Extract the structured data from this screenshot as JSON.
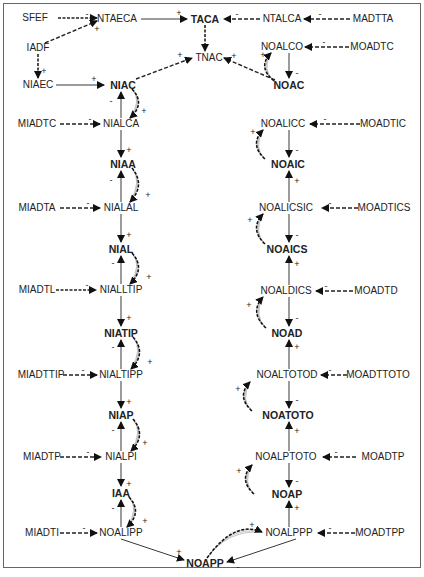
{
  "diagram": {
    "nodes": [
      {
        "id": "SFEF",
        "label": "SFEF",
        "x": 35,
        "y": 18,
        "bold": false
      },
      {
        "id": "NTAECA",
        "label": "NTAECA",
        "x": 117,
        "y": 19,
        "bold": false
      },
      {
        "id": "TACA",
        "label": "TACA",
        "x": 205,
        "y": 19,
        "bold": true
      },
      {
        "id": "NTALCA",
        "label": "NTALCA",
        "x": 282,
        "y": 19,
        "bold": false
      },
      {
        "id": "MADTTA",
        "label": "MADTTA",
        "x": 373,
        "y": 19,
        "bold": false
      },
      {
        "id": "IADF",
        "label": "IADF",
        "x": 38,
        "y": 48,
        "bold": false
      },
      {
        "id": "TNAC",
        "label": "TNAC",
        "x": 209,
        "y": 58,
        "bold": false
      },
      {
        "id": "NOALCO",
        "label": "NOALCO",
        "x": 282,
        "y": 47,
        "bold": false
      },
      {
        "id": "MOADTC",
        "label": "MOADTC",
        "x": 372,
        "y": 47,
        "bold": false
      },
      {
        "id": "NIAEC",
        "label": "NIAEC",
        "x": 38,
        "y": 85,
        "bold": false
      },
      {
        "id": "NIAC",
        "label": "NIAC",
        "x": 123,
        "y": 85,
        "bold": true
      },
      {
        "id": "NOAC",
        "label": "NOAC",
        "x": 289,
        "y": 85,
        "bold": true
      },
      {
        "id": "MIADTC",
        "label": "MIADTC",
        "x": 37,
        "y": 124,
        "bold": false
      },
      {
        "id": "NIALCA",
        "label": "NIALCA",
        "x": 121,
        "y": 124,
        "bold": false
      },
      {
        "id": "NOALICC",
        "label": "NOALICC",
        "x": 283,
        "y": 124,
        "bold": false
      },
      {
        "id": "MOADTIC",
        "label": "MOADTIC",
        "x": 383,
        "y": 124,
        "bold": false
      },
      {
        "id": "NIAA",
        "label": "NIAA",
        "x": 123,
        "y": 164,
        "bold": true
      },
      {
        "id": "NOAIC",
        "label": "NOAIC",
        "x": 288,
        "y": 164,
        "bold": true
      },
      {
        "id": "MIADTA",
        "label": "MIADTA",
        "x": 37,
        "y": 208,
        "bold": false
      },
      {
        "id": "NIALAL",
        "label": "NIALAL",
        "x": 121,
        "y": 208,
        "bold": false
      },
      {
        "id": "NOALICSIC",
        "label": "NOALICSIC",
        "x": 286,
        "y": 208,
        "bold": false
      },
      {
        "id": "MOADTICS",
        "label": "MOADTICS",
        "x": 384,
        "y": 208,
        "bold": false
      },
      {
        "id": "NIAL",
        "label": "NIAL",
        "x": 121,
        "y": 249,
        "bold": true
      },
      {
        "id": "NOAICS",
        "label": "NOAICS",
        "x": 287,
        "y": 249,
        "bold": true
      },
      {
        "id": "MIADTL",
        "label": "MIADTL",
        "x": 37,
        "y": 290,
        "bold": false
      },
      {
        "id": "NIALLTIP",
        "label": "NIALLTIP",
        "x": 121,
        "y": 290,
        "bold": false
      },
      {
        "id": "NOALDICS",
        "label": "NOALDICS",
        "x": 286,
        "y": 291,
        "bold": false
      },
      {
        "id": "MOADTD",
        "label": "MOADTD",
        "x": 376,
        "y": 291,
        "bold": false
      },
      {
        "id": "NIATIP",
        "label": "NIATIP",
        "x": 121,
        "y": 333,
        "bold": true
      },
      {
        "id": "NOAD",
        "label": "NOAD",
        "x": 287,
        "y": 333,
        "bold": true
      },
      {
        "id": "MIADTTIP",
        "label": "MIADTTIP",
        "x": 41,
        "y": 375,
        "bold": false
      },
      {
        "id": "NIALTIPP",
        "label": "NIALTIPP",
        "x": 121,
        "y": 375,
        "bold": false
      },
      {
        "id": "NOALTOTOD",
        "label": "NOALTOTOD",
        "x": 287,
        "y": 375,
        "bold": false
      },
      {
        "id": "MOADTTOTO",
        "label": "MOADTTOTO",
        "x": 378,
        "y": 375,
        "bold": false
      },
      {
        "id": "NIAP",
        "label": "NIAP",
        "x": 121,
        "y": 415,
        "bold": true
      },
      {
        "id": "NOATOTO",
        "label": "NOATOTO",
        "x": 288,
        "y": 415,
        "bold": true
      },
      {
        "id": "MIADTP",
        "label": "MIADTP",
        "x": 42,
        "y": 457,
        "bold": false
      },
      {
        "id": "NIALPI",
        "label": "NIALPI",
        "x": 121,
        "y": 457,
        "bold": false
      },
      {
        "id": "NOALPTOTO",
        "label": "NOALPTOTO",
        "x": 286,
        "y": 457,
        "bold": false
      },
      {
        "id": "MOADTP2",
        "label": "MOADTP",
        "x": 383,
        "y": 457,
        "bold": false
      },
      {
        "id": "IAA",
        "label": "IAA",
        "x": 121,
        "y": 493,
        "bold": true
      },
      {
        "id": "NOAP",
        "label": "NOAP",
        "x": 287,
        "y": 494,
        "bold": true
      },
      {
        "id": "MIADTI",
        "label": "MIADTI",
        "x": 42,
        "y": 533,
        "bold": false
      },
      {
        "id": "NOALIPP",
        "label": "NOALIPP",
        "x": 121,
        "y": 533,
        "bold": false
      },
      {
        "id": "NOALPPP",
        "label": "NOALPPP",
        "x": 289,
        "y": 533,
        "bold": false
      },
      {
        "id": "MOADTPP",
        "label": "MOADTPP",
        "x": 380,
        "y": 533,
        "bold": false
      },
      {
        "id": "NOAPP",
        "label": "NOAPP",
        "x": 205,
        "y": 563,
        "bold": true
      }
    ],
    "edges": [
      {
        "from": [
          58,
          18
        ],
        "to": [
          97,
          18
        ],
        "style": "dashed-double",
        "sign": "-",
        "sx": 87,
        "sy": 14
      },
      {
        "from": [
          45,
          43
        ],
        "to": [
          97,
          21
        ],
        "style": "dashed",
        "sign": "+",
        "sx": 97,
        "sy": 29
      },
      {
        "from": [
          141,
          19
        ],
        "to": [
          187,
          19
        ],
        "style": "solid",
        "sign": "+",
        "sx": 179,
        "sy": 13
      },
      {
        "from": [
          260,
          19
        ],
        "to": [
          224,
          19
        ],
        "style": "dashed",
        "sign": "-",
        "sx": 237,
        "sy": 14
      },
      {
        "from": [
          350,
          19
        ],
        "to": [
          304,
          19
        ],
        "style": "dashed",
        "sign": "-",
        "sx": 320,
        "sy": 14
      },
      {
        "from": [
          205,
          25
        ],
        "to": [
          205,
          51
        ],
        "style": "dashed-double",
        "sign": "",
        "sx": 0,
        "sy": 0
      },
      {
        "from": [
          38,
          54
        ],
        "to": [
          38,
          78
        ],
        "style": "dashed-double",
        "sign": "+",
        "sx": 44,
        "sy": 71
      },
      {
        "from": [
          56,
          85
        ],
        "to": [
          104,
          85
        ],
        "style": "solid",
        "sign": "+",
        "sx": 94,
        "sy": 79
      },
      {
        "from": [
          136,
          79
        ],
        "to": [
          192,
          58
        ],
        "style": "dashed",
        "sign": "+",
        "sx": 180,
        "sy": 55
      },
      {
        "from": [
          275,
          80
        ],
        "to": [
          224,
          58
        ],
        "style": "dashed",
        "sign": "+",
        "sx": 234,
        "sy": 56
      },
      {
        "from": [
          349,
          47
        ],
        "to": [
          305,
          47
        ],
        "style": "dashed",
        "sign": "-",
        "sx": 324,
        "sy": 42
      },
      {
        "from": [
          289,
          53
        ],
        "to": [
          289,
          78
        ],
        "style": "solid",
        "sign": "-",
        "sx": 297,
        "sy": 73
      },
      {
        "from": [
          60,
          124
        ],
        "to": [
          100,
          124
        ],
        "style": "dashed",
        "sign": "-",
        "sx": 90,
        "sy": 119
      },
      {
        "from": [
          121,
          118
        ],
        "to": [
          121,
          92
        ],
        "style": "solid",
        "sign": "-",
        "sx": 111,
        "sy": 101
      },
      {
        "from": [
          121,
          130
        ],
        "to": [
          121,
          157
        ],
        "style": "solid",
        "sign": "+",
        "sx": 129,
        "sy": 150
      },
      {
        "from": [
          360,
          124
        ],
        "to": [
          310,
          124
        ],
        "style": "dashed",
        "sign": "-",
        "sx": 325,
        "sy": 119
      },
      {
        "from": [
          289,
          130
        ],
        "to": [
          289,
          157
        ],
        "style": "solid",
        "sign": "-",
        "sx": 297,
        "sy": 150
      },
      {
        "from": [
          60,
          208
        ],
        "to": [
          100,
          208
        ],
        "style": "dashed",
        "sign": "-",
        "sx": 88,
        "sy": 203
      },
      {
        "from": [
          121,
          202
        ],
        "to": [
          121,
          171
        ],
        "style": "solid",
        "sign": "-",
        "sx": 111,
        "sy": 180
      },
      {
        "from": [
          121,
          214
        ],
        "to": [
          121,
          242
        ],
        "style": "solid",
        "sign": "+",
        "sx": 129,
        "sy": 235
      },
      {
        "from": [
          358,
          208
        ],
        "to": [
          322,
          208
        ],
        "style": "dashed",
        "sign": "-",
        "sx": 330,
        "sy": 203
      },
      {
        "from": [
          289,
          202
        ],
        "to": [
          289,
          171
        ],
        "style": "solid",
        "sign": "+",
        "sx": 297,
        "sy": 181
      },
      {
        "from": [
          289,
          214
        ],
        "to": [
          289,
          242
        ],
        "style": "solid",
        "sign": "-",
        "sx": 297,
        "sy": 235
      },
      {
        "from": [
          56,
          290
        ],
        "to": [
          96,
          290
        ],
        "style": "dashed-double",
        "sign": "-",
        "sx": 87,
        "sy": 285
      },
      {
        "from": [
          121,
          284
        ],
        "to": [
          121,
          256
        ],
        "style": "solid",
        "sign": "-",
        "sx": 113,
        "sy": 263
      },
      {
        "from": [
          121,
          296
        ],
        "to": [
          121,
          326
        ],
        "style": "solid",
        "sign": "+",
        "sx": 129,
        "sy": 318
      },
      {
        "from": [
          353,
          291
        ],
        "to": [
          316,
          291
        ],
        "style": "dashed",
        "sign": "-",
        "sx": 326,
        "sy": 286
      },
      {
        "from": [
          289,
          285
        ],
        "to": [
          289,
          256
        ],
        "style": "solid",
        "sign": "+",
        "sx": 297,
        "sy": 264
      },
      {
        "from": [
          289,
          297
        ],
        "to": [
          289,
          326
        ],
        "style": "solid",
        "sign": "-",
        "sx": 297,
        "sy": 318
      },
      {
        "from": [
          63,
          375
        ],
        "to": [
          97,
          375
        ],
        "style": "dashed",
        "sign": "-",
        "sx": 83,
        "sy": 370
      },
      {
        "from": [
          121,
          369
        ],
        "to": [
          121,
          340
        ],
        "style": "solid",
        "sign": "-",
        "sx": 113,
        "sy": 347
      },
      {
        "from": [
          121,
          381
        ],
        "to": [
          121,
          408
        ],
        "style": "solid",
        "sign": "+",
        "sx": 129,
        "sy": 402
      },
      {
        "from": [
          347,
          375
        ],
        "to": [
          321,
          375
        ],
        "style": "dashed",
        "sign": "-",
        "sx": 330,
        "sy": 370
      },
      {
        "from": [
          289,
          369
        ],
        "to": [
          289,
          340
        ],
        "style": "solid",
        "sign": "+",
        "sx": 297,
        "sy": 347
      },
      {
        "from": [
          289,
          381
        ],
        "to": [
          289,
          408
        ],
        "style": "solid",
        "sign": "-",
        "sx": 297,
        "sy": 400
      },
      {
        "from": [
          60,
          457
        ],
        "to": [
          101,
          457
        ],
        "style": "dashed",
        "sign": "-",
        "sx": 88,
        "sy": 452
      },
      {
        "from": [
          121,
          451
        ],
        "to": [
          121,
          422
        ],
        "style": "solid",
        "sign": "-",
        "sx": 113,
        "sy": 430
      },
      {
        "from": [
          121,
          463
        ],
        "to": [
          121,
          486
        ],
        "style": "solid",
        "sign": "+",
        "sx": 129,
        "sy": 484
      },
      {
        "from": [
          356,
          457
        ],
        "to": [
          323,
          457
        ],
        "style": "dashed",
        "sign": "-",
        "sx": 336,
        "sy": 452
      },
      {
        "from": [
          289,
          451
        ],
        "to": [
          289,
          422
        ],
        "style": "solid",
        "sign": "+",
        "sx": 297,
        "sy": 431
      },
      {
        "from": [
          289,
          463
        ],
        "to": [
          289,
          487
        ],
        "style": "solid",
        "sign": "-",
        "sx": 297,
        "sy": 481
      },
      {
        "from": [
          60,
          533
        ],
        "to": [
          97,
          533
        ],
        "style": "dashed",
        "sign": "-",
        "sx": 84,
        "sy": 528
      },
      {
        "from": [
          121,
          527
        ],
        "to": [
          121,
          500
        ],
        "style": "solid",
        "sign": "-",
        "sx": 113,
        "sy": 508
      },
      {
        "from": [
          355,
          533
        ],
        "to": [
          318,
          533
        ],
        "style": "dashed",
        "sign": "-",
        "sx": 330,
        "sy": 528
      },
      {
        "from": [
          289,
          527
        ],
        "to": [
          289,
          501
        ],
        "style": "solid",
        "sign": "+",
        "sx": 297,
        "sy": 508
      },
      {
        "from": [
          121,
          539
        ],
        "to": [
          184,
          560
        ],
        "style": "solid",
        "sign": "+",
        "sx": 179,
        "sy": 552
      },
      {
        "from": [
          296,
          539
        ],
        "to": [
          227,
          562
        ],
        "style": "solid",
        "sign": "-",
        "sx": 238,
        "sy": 567
      }
    ],
    "loops": [
      {
        "x1": 132,
        "y1": 89,
        "x2": 130,
        "y2": 118,
        "side": "right",
        "sign": "+",
        "sx": 144,
        "sy": 111
      },
      {
        "x1": 132,
        "y1": 168,
        "x2": 130,
        "y2": 202,
        "side": "right",
        "sign": "+",
        "sx": 148,
        "sy": 195
      },
      {
        "x1": 132,
        "y1": 253,
        "x2": 130,
        "y2": 284,
        "side": "right",
        "sign": "+",
        "sx": 149,
        "sy": 277
      },
      {
        "x1": 133,
        "y1": 337,
        "x2": 131,
        "y2": 369,
        "side": "right",
        "sign": "+",
        "sx": 150,
        "sy": 362
      },
      {
        "x1": 133,
        "y1": 419,
        "x2": 131,
        "y2": 451,
        "side": "right",
        "sign": "+",
        "sx": 145,
        "sy": 443
      },
      {
        "x1": 129,
        "y1": 497,
        "x2": 127,
        "y2": 527,
        "side": "right",
        "sign": "+",
        "sx": 145,
        "sy": 521
      },
      {
        "x1": 274,
        "y1": 81,
        "x2": 271,
        "y2": 53,
        "side": "left",
        "sign": "+",
        "sx": 263,
        "sy": 55
      },
      {
        "x1": 265,
        "y1": 159,
        "x2": 263,
        "y2": 130,
        "side": "left",
        "sign": "+",
        "sx": 253,
        "sy": 132
      },
      {
        "x1": 265,
        "y1": 244,
        "x2": 263,
        "y2": 214,
        "side": "left",
        "sign": "+",
        "sx": 250,
        "sy": 220
      },
      {
        "x1": 266,
        "y1": 328,
        "x2": 263,
        "y2": 297,
        "side": "left",
        "sign": "+",
        "sx": 249,
        "sy": 305
      },
      {
        "x1": 252,
        "y1": 411,
        "x2": 250,
        "y2": 382,
        "side": "left",
        "sign": "+",
        "sx": 238,
        "sy": 389
      },
      {
        "x1": 254,
        "y1": 494,
        "x2": 252,
        "y2": 465,
        "side": "left",
        "sign": "+",
        "sx": 239,
        "sy": 471
      },
      {
        "x1": 207,
        "y1": 558,
        "x2": 262,
        "y2": 532,
        "side": "top",
        "sign": "+",
        "sx": 252,
        "sy": 525
      }
    ]
  }
}
